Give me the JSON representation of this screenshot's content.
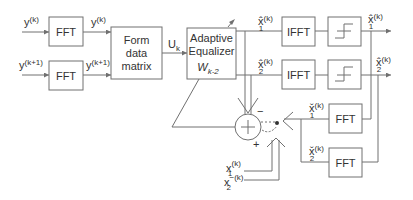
{
  "diagram": {
    "inputs": {
      "y_k": {
        "base": "y",
        "sup": "(k)"
      },
      "y_k1": {
        "base": "y",
        "sup": "(k+1)"
      },
      "x1_k": {
        "base": "x",
        "sub": "1",
        "sup": "(k)"
      },
      "x2_k": {
        "base": "x",
        "sub": "2",
        "sup": "−(k)"
      }
    },
    "blocks": {
      "fft_top": "FFT",
      "fft_bottom": "FFT",
      "form_matrix": [
        "Form",
        "data",
        "matrix"
      ],
      "equalizer": [
        "Adaptive",
        "Equalizer"
      ],
      "equalizer_weight": {
        "base": "W",
        "sub": "k-2"
      },
      "ifft_1": "IFFT",
      "ifft_2": "IFFT",
      "fft_fb1": "FFT",
      "fft_fb2": "FFT"
    },
    "signals": {
      "fft_out_1": {
        "base": "y",
        "sup": "(k)"
      },
      "fft_out_2": {
        "base": "y",
        "sup": "(k+1)"
      },
      "matrix_out": {
        "base": "U",
        "sub": "k"
      },
      "eq_out_1": {
        "base": "x̂",
        "sub": "1",
        "sup": "(k)"
      },
      "eq_out_2": {
        "base": "x̂",
        "sub": "2",
        "sup": "(k)"
      },
      "out_1": {
        "base": "x̂",
        "sub": "1",
        "sup": "(k)"
      },
      "out_2": {
        "base": "x̂",
        "sub": "2",
        "sup": "(k)"
      },
      "fb_1": {
        "base": "x̌",
        "sub": "1",
        "sup": "(k)"
      },
      "fb_2": {
        "base": "x̌",
        "sub": "2",
        "sup": "(k)"
      }
    },
    "summer": {
      "symbol": "+",
      "minus_sign": "−",
      "plus_sign": "+"
    }
  }
}
